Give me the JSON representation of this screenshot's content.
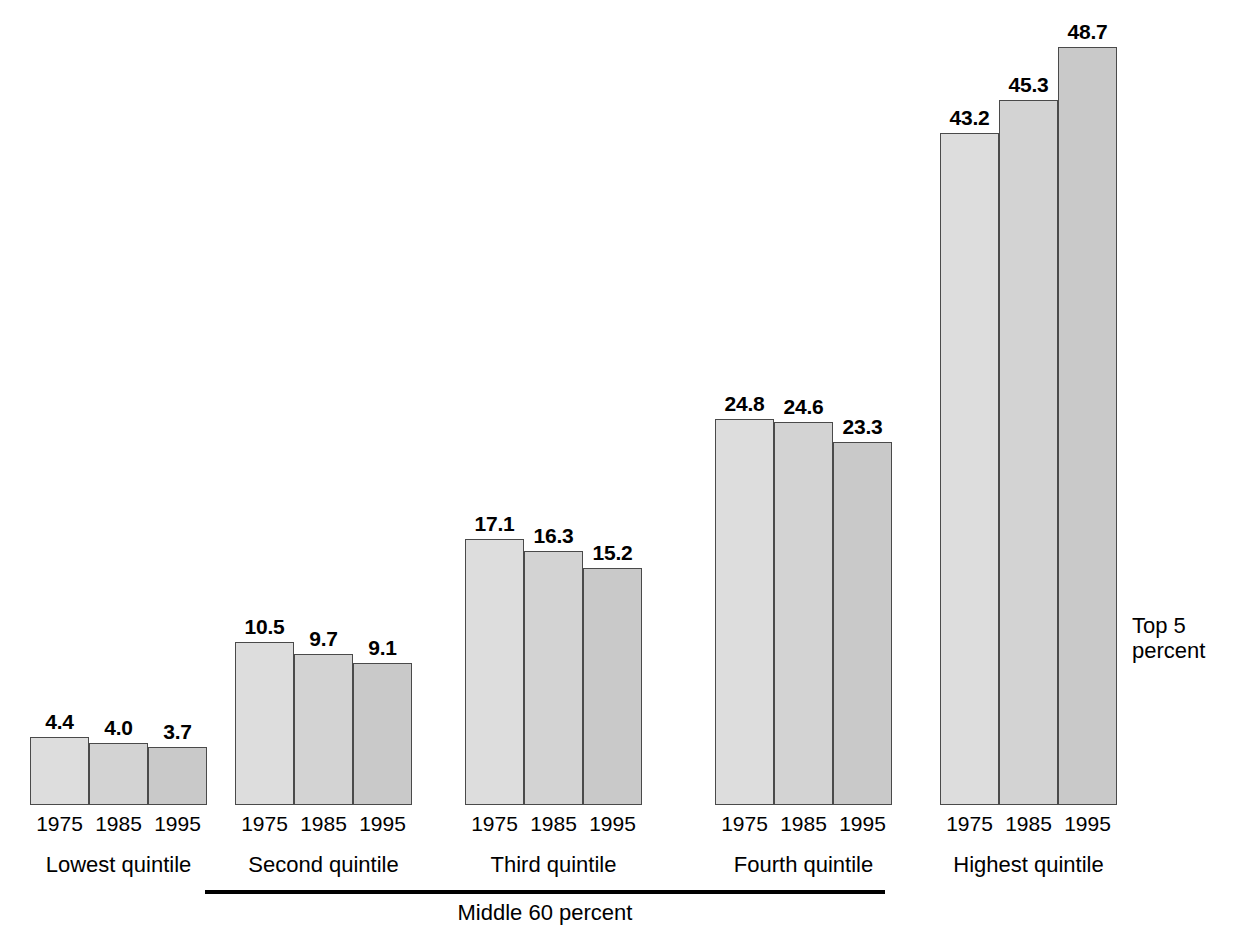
{
  "chart_data": {
    "type": "bar",
    "title": "",
    "subtitle": "",
    "xlabel": "",
    "ylabel": "",
    "grid": false,
    "legend_position": "none",
    "ylim": [
      0,
      48.7
    ],
    "categories": [
      "Lowest quintile",
      "Second quintile",
      "Third quintile",
      "Fourth quintile",
      "Highest quintile"
    ],
    "x": [
      "1975",
      "1985",
      "1995"
    ],
    "series": [
      {
        "name": "1975",
        "values": [
          4.4,
          10.5,
          17.1,
          24.8,
          43.2
        ]
      },
      {
        "name": "1985",
        "values": [
          4.0,
          9.7,
          16.3,
          24.6,
          45.3
        ]
      },
      {
        "name": "1995",
        "values": [
          3.7,
          9.1,
          15.2,
          23.3,
          48.7
        ]
      }
    ],
    "annotations": {
      "top5_percent": {
        "label": "Top 5\npercent",
        "values": [
          15.9,
          17.0,
          21.0
        ],
        "years": [
          "1975",
          "1985",
          "1995"
        ],
        "applies_to": "Highest quintile"
      },
      "middle_60_percent": {
        "label": "Middle 60 percent",
        "spans": [
          "Second quintile",
          "Third quintile",
          "Fourth quintile"
        ]
      }
    }
  },
  "groups": [
    {
      "name": "Lowest quintile",
      "bars": [
        {
          "year": "1975",
          "value": "4.4"
        },
        {
          "year": "1985",
          "value": "4.0"
        },
        {
          "year": "1995",
          "value": "3.7"
        }
      ]
    },
    {
      "name": "Second quintile",
      "bars": [
        {
          "year": "1975",
          "value": "10.5"
        },
        {
          "year": "1985",
          "value": "9.7"
        },
        {
          "year": "1995",
          "value": "9.1"
        }
      ]
    },
    {
      "name": "Third quintile",
      "bars": [
        {
          "year": "1975",
          "value": "17.1"
        },
        {
          "year": "1985",
          "value": "16.3"
        },
        {
          "year": "1995",
          "value": "15.2"
        }
      ]
    },
    {
      "name": "Fourth quintile",
      "bars": [
        {
          "year": "1975",
          "value": "24.8"
        },
        {
          "year": "1985",
          "value": "24.6"
        },
        {
          "year": "1995",
          "value": "23.3"
        }
      ]
    },
    {
      "name": "Highest quintile",
      "bars": [
        {
          "year": "1975",
          "value": "43.2",
          "top5": "15.9"
        },
        {
          "year": "1985",
          "value": "45.3",
          "top5": "17.0"
        },
        {
          "year": "1995",
          "value": "48.7",
          "top5": "21.0"
        }
      ]
    }
  ],
  "bracket": {
    "label": "Middle 60 percent"
  },
  "top5_note": {
    "line1": "Top 5",
    "line2": "percent"
  },
  "colors": {
    "bar_1975": "#dddddd",
    "bar_1985": "#d3d3d3",
    "bar_1995": "#c9c9c9",
    "bar_border": "#4a4a4a",
    "text": "#000000",
    "divider": "#111111",
    "background": "#ffffff"
  }
}
